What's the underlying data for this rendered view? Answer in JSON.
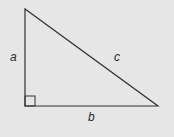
{
  "diagram": {
    "type": "right-triangle",
    "background": "#e6e6e6",
    "stroke": "#333333",
    "vertices": {
      "top": [
        25,
        9
      ],
      "right_angle": [
        25,
        106
      ],
      "right": [
        158,
        106
      ]
    },
    "right_angle_marker_size": 10,
    "labels": {
      "a": "a",
      "b": "b",
      "c": "c"
    },
    "label_positions": {
      "a": [
        13,
        61
      ],
      "b": [
        91,
        121
      ],
      "c": [
        117,
        61
      ]
    }
  }
}
